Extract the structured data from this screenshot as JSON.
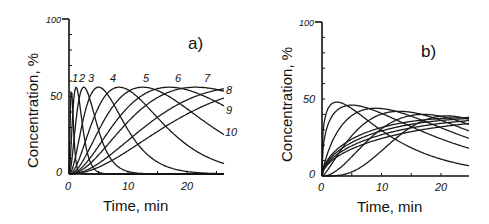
{
  "chart_data": [
    {
      "type": "line",
      "panel_label": "a)",
      "xlabel": "Time, min",
      "ylabel": "Concentration, %",
      "xlim": [
        0,
        26
      ],
      "ylim": [
        0,
        100
      ],
      "xticks": [
        0,
        10,
        20
      ],
      "yticks_labeled": [
        0,
        50,
        100
      ],
      "grid": false,
      "legend": "inline curve numbers 1-10",
      "curve_labels": [
        "1",
        "2",
        "3",
        "4",
        "5",
        "6",
        "7",
        "8",
        "9",
        "10"
      ],
      "series": [
        {
          "name": "1",
          "peak_time": 0.4,
          "peak_value": 55
        },
        {
          "name": "2",
          "peak_time": 1.2,
          "peak_value": 56
        },
        {
          "name": "3",
          "peak_time": 2.5,
          "peak_value": 56
        },
        {
          "name": "4",
          "peak_time": 5.0,
          "peak_value": 56
        },
        {
          "name": "5",
          "peak_time": 8.5,
          "peak_value": 56
        },
        {
          "name": "6",
          "peak_time": 12.5,
          "peak_value": 56
        },
        {
          "name": "7",
          "peak_time": 17.0,
          "peak_value": 56
        },
        {
          "name": "8",
          "peak_time": 21.5,
          "peak_value": 56
        },
        {
          "name": "9",
          "peak_time": 30.0,
          "peak_value": 56,
          "value_at_26": 45
        },
        {
          "name": "10",
          "peak_time": 38.0,
          "peak_value": 56,
          "value_at_26": 30
        }
      ]
    },
    {
      "type": "line",
      "panel_label": "b)",
      "xlabel": "Time, min",
      "ylabel": "Concentration, %",
      "xlim": [
        0,
        25
      ],
      "ylim": [
        0,
        100
      ],
      "xticks": [
        0,
        10,
        20
      ],
      "yticks_labeled": [
        0,
        50,
        100
      ],
      "grid": false,
      "series": [
        {
          "name": "1",
          "peak_time": 2.5,
          "peak_value": 48,
          "value_at_25": 10
        },
        {
          "name": "2",
          "peak_time": 5.0,
          "peak_value": 46,
          "value_at_25": 17
        },
        {
          "name": "3",
          "peak_time": 9.0,
          "peak_value": 44,
          "value_at_25": 24
        },
        {
          "name": "4",
          "peak_time": 13.0,
          "peak_value": 42,
          "value_at_25": 29
        },
        {
          "name": "5",
          "peak_time": 17.0,
          "peak_value": 40,
          "value_at_25": 33
        },
        {
          "name": "6",
          "peak_time": 21.0,
          "peak_value": 39,
          "value_at_25": 36
        },
        {
          "name": "7",
          "peak_time": 26.0,
          "peak_value": 38,
          "value_at_25": 38
        },
        {
          "name": "8",
          "peak_time": 32.0,
          "peak_value": 38,
          "value_at_25": 35
        },
        {
          "name": "9",
          "peak_time": 40.0,
          "peak_value": 38,
          "value_at_25": 31
        },
        {
          "name": "10",
          "peak_time": 50.0,
          "peak_value": 38,
          "value_at_25": 27
        }
      ]
    }
  ],
  "panels": {
    "a": {
      "label": "a)",
      "xlabel": "Time, min",
      "ylabel": "Concentration, %",
      "xtick_labels": [
        "0",
        "10",
        "20"
      ],
      "ytick_labels": [
        "0",
        "50",
        "100"
      ],
      "curve_top_labels": [
        "1",
        "2",
        "3",
        "4",
        "5",
        "6",
        "7"
      ],
      "curve_right_labels": [
        "8",
        "9",
        "10"
      ]
    },
    "b": {
      "label": "b)",
      "xlabel": "Time, min",
      "ylabel": "Concentration, %",
      "xtick_labels": [
        "0",
        "10",
        "20"
      ],
      "ytick_labels": [
        "0",
        "50",
        "100"
      ]
    }
  }
}
